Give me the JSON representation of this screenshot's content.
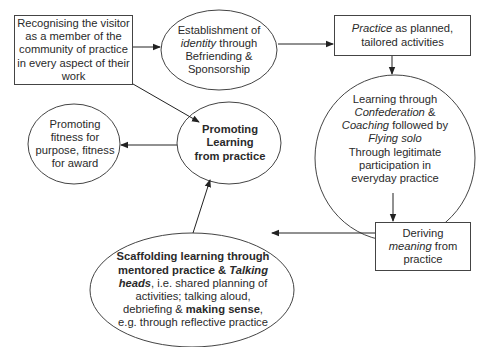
{
  "colors": {
    "stroke": "#333333",
    "text": "#2a2a2a",
    "background": "#ffffff"
  },
  "nodes": {
    "recognising": {
      "shape": "box",
      "lines": [
        "Recognising the visitor",
        "as a member of the",
        "community of practice",
        "in every aspect of their",
        "work"
      ]
    },
    "identity": {
      "shape": "ellipse",
      "line1": "Establishment of",
      "line2_italic": "identity",
      "line2_rest": " through",
      "line3": "Befriending &",
      "line4": "Sponsorship"
    },
    "practice": {
      "shape": "box",
      "line1_italic": "Practice",
      "line1_rest": " as planned,",
      "line2": "tailored activities"
    },
    "learning_through": {
      "shape": "ellipse",
      "line1": "Learning through",
      "line2_italic": "Confederation",
      "line2_rest": " &",
      "line3_italic": "Coaching",
      "line3_rest": " followed by",
      "line4_italic": "Flying solo",
      "line5": "Through legitimate",
      "line6": "participation in",
      "line7": "everyday practice"
    },
    "deriving": {
      "shape": "box",
      "line1": "Deriving",
      "line2_italic": "meaning",
      "line2_rest": " from",
      "line3": "practice"
    },
    "scaffolding": {
      "shape": "ellipse",
      "line1_bold": "Scaffolding learning through",
      "line2_bold": "mentored practice & ",
      "line2_bold_italic": "Talking",
      "line3_bold_italic": "heads",
      "line3_rest": ", i.e. shared planning of",
      "line4": "activities; talking aloud,",
      "line5_pre": "debriefing & ",
      "line5_bold": "making sense",
      "line5_post": ",",
      "line6": "e.g. through reflective practice"
    },
    "promoting_learning": {
      "shape": "ellipse",
      "lines_bold": [
        "Promoting",
        "Learning",
        "from practice"
      ]
    },
    "fitness": {
      "shape": "ellipse",
      "lines": [
        "Promoting",
        "fitness for",
        "purpose, fitness",
        "for award"
      ]
    }
  },
  "edges": [
    {
      "from": "recognising",
      "to": "identity"
    },
    {
      "from": "recognising",
      "to": "promoting_learning"
    },
    {
      "from": "identity",
      "to": "practice"
    },
    {
      "from": "practice",
      "to": "learning_through"
    },
    {
      "from": "learning_through",
      "to": "deriving"
    },
    {
      "from": "deriving",
      "to": "scaffolding"
    },
    {
      "from": "scaffolding",
      "to": "promoting_learning"
    },
    {
      "from": "promoting_learning",
      "to": "fitness"
    }
  ]
}
